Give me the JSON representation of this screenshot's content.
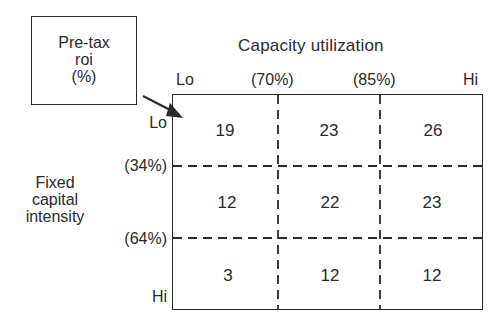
{
  "legend_box": {
    "line1": "Pre-tax",
    "line2": "roi",
    "line3": "(%)"
  },
  "x_axis": {
    "title": "Capacity utilization",
    "ticks": [
      "Lo",
      "(70%)",
      "(85%)",
      "Hi"
    ]
  },
  "y_axis": {
    "title_line1": "Fixed",
    "title_line2": "capital",
    "title_line3": "intensity",
    "ticks": [
      "Lo",
      "(34%)",
      "(64%)",
      "Hi"
    ]
  },
  "matrix": {
    "rows": [
      [
        "19",
        "23",
        "26"
      ],
      [
        "12",
        "22",
        "23"
      ],
      [
        "3",
        "12",
        "12"
      ]
    ]
  },
  "colors": {
    "ink": "#2a2a2a",
    "background": "#ffffff"
  }
}
